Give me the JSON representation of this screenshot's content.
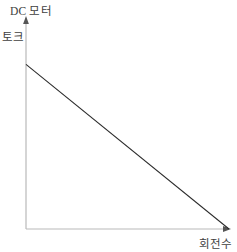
{
  "chart_data": {
    "type": "line",
    "title": "DC 모터",
    "subtitle": "",
    "xlabel": "회전수",
    "ylabel": "토크",
    "legend": [],
    "grid": false,
    "legend_position": "none",
    "xlim": [
      0,
      100
    ],
    "ylim": [
      0,
      100
    ],
    "xticks": [],
    "yticks": [],
    "xticklabels": [],
    "yticklabels": [],
    "annotations": [],
    "series": [
      {
        "name": "토크 특성",
        "color": "#2b2b2b",
        "x": [
          0,
          100
        ],
        "y": [
          78,
          0
        ]
      }
    ]
  },
  "figure": {
    "background_color": "#ffffff",
    "axis_color": "#b9b9b9",
    "line_color": "#2b2b2b",
    "text_color": "#404040",
    "axes": {
      "y_axis_name": "torque-axis",
      "x_axis_name": "speed-axis",
      "origin_px": [
        26,
        229
      ],
      "y_top_px": [
        26,
        18
      ],
      "x_right_px": [
        229,
        229
      ],
      "line_start_px": [
        26,
        96
      ],
      "line_end_px": [
        197,
        229
      ]
    }
  }
}
